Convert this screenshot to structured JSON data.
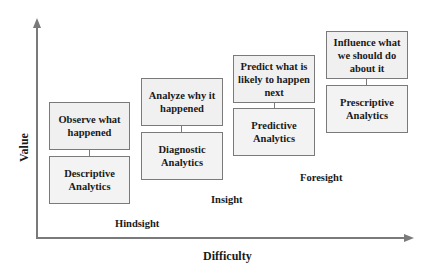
{
  "diagram": {
    "axes": {
      "x_label": "Difficulty",
      "y_label": "Value"
    },
    "stages": [
      {
        "goal": "Observe what happened",
        "analytics": "Descriptive Analytics"
      },
      {
        "goal": "Analyze why it happened",
        "analytics": "Diagnostic Analytics"
      },
      {
        "goal": "Predict what is likely to happen next",
        "analytics": "Predictive Analytics"
      },
      {
        "goal": "Influence what we should do about it",
        "analytics": "Prescriptive Analytics"
      }
    ],
    "zones": {
      "hindsight": "Hindsight",
      "insight": "Insight",
      "foresight": "Foresight"
    },
    "colors": {
      "axis": "#7a7a7a",
      "box_border": "#7a7a7a",
      "box_fill": "#f0f0f0",
      "text": "#1a1a1a"
    }
  }
}
